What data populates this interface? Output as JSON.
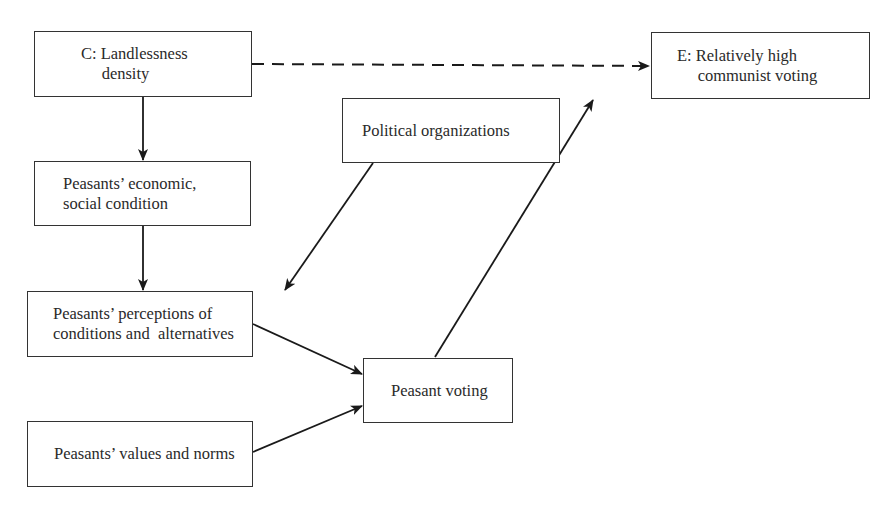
{
  "diagram": {
    "nodes": {
      "c": {
        "label": "C: Landlessness\n     density"
      },
      "econ": {
        "label": "Peasants’ economic,\nsocial condition"
      },
      "political": {
        "label": "Political organizations"
      },
      "e": {
        "label": "E: Relatively high\n     communist voting"
      },
      "perceptions": {
        "label": "Peasants’ perceptions of\nconditions and  alternatives"
      },
      "values": {
        "label": "Peasants’ values and norms"
      },
      "voting": {
        "label": "Peasant voting"
      }
    },
    "edges": [
      {
        "from": "c",
        "to": "e",
        "style": "dashed"
      },
      {
        "from": "c",
        "to": "econ",
        "style": "solid"
      },
      {
        "from": "econ",
        "to": "perceptions",
        "style": "solid"
      },
      {
        "from": "political",
        "to": "perceptions",
        "style": "solid"
      },
      {
        "from": "perceptions",
        "to": "voting",
        "style": "solid"
      },
      {
        "from": "values",
        "to": "voting",
        "style": "solid"
      },
      {
        "from": "voting",
        "to": "e",
        "style": "solid"
      }
    ]
  }
}
